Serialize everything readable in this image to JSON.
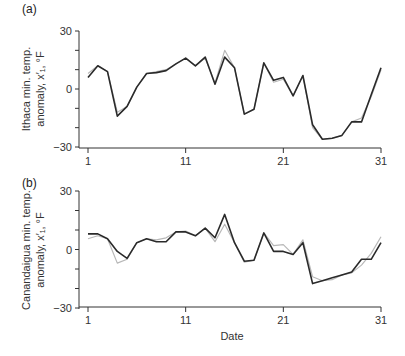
{
  "chart_data": [
    {
      "type": "line",
      "panel_label": "(a)",
      "title": "",
      "xlabel": "",
      "ylabel_line1": "Ithaca min. temp.",
      "ylabel_line2": "anomaly, x′₁, °F",
      "ylim": [
        -30,
        30
      ],
      "yticks": [
        30,
        0,
        -30
      ],
      "ytick_labels": [
        "30",
        "0",
        "−30"
      ],
      "xlim": [
        1,
        31
      ],
      "xticks": [
        1,
        11,
        21,
        31
      ],
      "xtick_labels": [
        "1",
        "11",
        "21",
        "31"
      ],
      "grid": false,
      "x": [
        1,
        2,
        3,
        4,
        5,
        6,
        7,
        8,
        9,
        10,
        11,
        12,
        13,
        14,
        15,
        16,
        17,
        18,
        19,
        20,
        21,
        22,
        23,
        24,
        25,
        26,
        27,
        28,
        29,
        30,
        31
      ],
      "series": [
        {
          "name": "observed",
          "color": "#2a2a2a",
          "values": [
            6,
            12,
            9,
            -14,
            -9,
            1,
            8,
            8.5,
            9.5,
            13,
            16,
            12,
            16.5,
            2.5,
            16.5,
            11,
            -13,
            -10.5,
            13.5,
            4.5,
            6,
            -3.5,
            7,
            -18.5,
            -26,
            -25.5,
            -24,
            -17,
            -17,
            -3,
            11
          ]
        },
        {
          "name": "estimated",
          "color": "#b8b8b8",
          "values": [
            8,
            12,
            9,
            -12,
            -9,
            1,
            8,
            9,
            10,
            13,
            16,
            12,
            16,
            3,
            20,
            11,
            -13,
            -10.5,
            13.5,
            3.5,
            5,
            -3.5,
            7,
            -20,
            -26,
            -25.5,
            -24,
            -17,
            -15,
            -4,
            10
          ]
        }
      ]
    },
    {
      "type": "line",
      "panel_label": "(b)",
      "title": "",
      "xlabel": "Date",
      "ylabel_line1": "Canandaigua min. temp.",
      "ylabel_line2": "anomaly, x′₁, °F",
      "ylim": [
        -30,
        30
      ],
      "yticks": [
        30,
        0,
        -30
      ],
      "ytick_labels": [
        "30",
        "0",
        "−30"
      ],
      "xlim": [
        1,
        31
      ],
      "xticks": [
        1,
        11,
        21,
        31
      ],
      "xtick_labels": [
        "1",
        "11",
        "21",
        "31"
      ],
      "grid": false,
      "x": [
        1,
        2,
        3,
        4,
        5,
        6,
        7,
        8,
        9,
        10,
        11,
        12,
        13,
        14,
        15,
        16,
        17,
        18,
        19,
        20,
        21,
        22,
        23,
        24,
        25,
        26,
        27,
        28,
        29,
        30,
        31
      ],
      "series": [
        {
          "name": "observed",
          "color": "#2a2a2a",
          "values": [
            8,
            8,
            5.5,
            -1,
            -4.5,
            3.5,
            5.5,
            4,
            4,
            9,
            9,
            7,
            11,
            6,
            18,
            3.5,
            -6,
            -5.5,
            8.5,
            -1,
            -1,
            -2.5,
            3.5,
            -17.5,
            -16,
            -14.5,
            -13,
            -11.5,
            -5,
            -5,
            3.5
          ]
        },
        {
          "name": "estimated",
          "color": "#b8b8b8",
          "values": [
            5.5,
            7,
            5.5,
            -7,
            -5,
            3.5,
            5.5,
            5,
            6,
            9,
            9.5,
            7,
            11,
            4,
            13,
            3.5,
            -6.5,
            -5.5,
            8.5,
            2,
            2.5,
            -2.5,
            5,
            -14,
            -16,
            -15.5,
            -13,
            -12,
            -8,
            -2,
            6.5
          ]
        }
      ]
    }
  ]
}
